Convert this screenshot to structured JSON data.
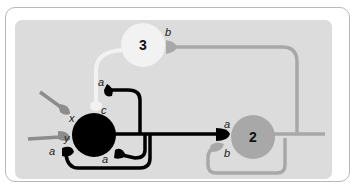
{
  "diagram": {
    "type": "neural-network-motif",
    "colors": {
      "panel": "#dcdcdc",
      "card_border": "#b8b8b8",
      "node1": "#000000",
      "node2": "#a8a8a8",
      "node3": "#f2f2f2",
      "input": "#8c8c8c",
      "edge_black": "#000000",
      "edge_gray": "#a8a8a8",
      "edge_white": "#f2f2f2"
    },
    "nodes": [
      {
        "id": "1",
        "label": "",
        "color": "#000000"
      },
      {
        "id": "2",
        "label": "2",
        "color": "#a8a8a8"
      },
      {
        "id": "3",
        "label": "3",
        "color": "#f2f2f2"
      }
    ],
    "inputs": [
      {
        "label": "x"
      },
      {
        "label": "y"
      }
    ],
    "synapse_labels": {
      "node1_c": "c",
      "node1_x": "x",
      "node1_y": "y",
      "node1_a_left": "a",
      "node1_a_bottom": "a",
      "node1_a_top": "a",
      "node2_a": "a",
      "node2_b": "b",
      "node3_b": "b"
    },
    "edges": [
      {
        "from": "input-x",
        "to": "1",
        "synapse": "x"
      },
      {
        "from": "input-y",
        "to": "1",
        "synapse": "y"
      },
      {
        "from": "3",
        "to": "1",
        "synapse": "c"
      },
      {
        "from": "1",
        "to": "1",
        "synapse": "a",
        "note": "self loop top"
      },
      {
        "from": "1",
        "to": "1",
        "synapse": "a",
        "note": "self loop bottom"
      },
      {
        "from": "1",
        "to": "1",
        "synapse": "a",
        "note": "self loop left"
      },
      {
        "from": "1",
        "to": "2",
        "synapse": "a"
      },
      {
        "from": "2",
        "to": "2",
        "synapse": "b"
      },
      {
        "from": "2",
        "to": "3",
        "synapse": "b"
      }
    ]
  }
}
